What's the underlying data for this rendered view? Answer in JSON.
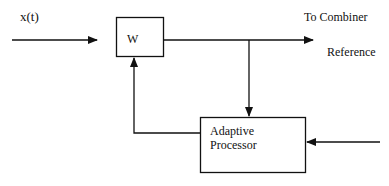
{
  "diagram": {
    "input_label": "x(t)",
    "weight_block": "W",
    "output_label": "To Combiner",
    "reference_label": "Reference",
    "processor_line1": "Adaptive",
    "processor_line2": "Processor"
  }
}
